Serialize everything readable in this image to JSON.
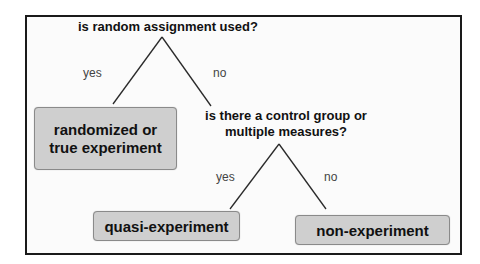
{
  "diagram": {
    "type": "decision-tree",
    "colors": {
      "frame_border": "#1a1a1a",
      "background": "#fbfbfb",
      "box_fill": "#cfcfcf",
      "box_border": "#8a8a8a",
      "line": "#2a2a2a",
      "edge_label": "#444444",
      "text": "#111111"
    },
    "root_question": {
      "text": "is random assignment used?"
    },
    "root_branches": {
      "yes_label": "yes",
      "no_label": "no"
    },
    "second_question": {
      "line1": "is there a control group or",
      "line2": "multiple measures?"
    },
    "second_branches": {
      "yes_label": "yes",
      "no_label": "no"
    },
    "outcomes": {
      "randomized": {
        "line1": "randomized or",
        "line2": "true experiment"
      },
      "quasi": {
        "text": "quasi-experiment"
      },
      "non": {
        "text": "non-experiment"
      }
    }
  }
}
